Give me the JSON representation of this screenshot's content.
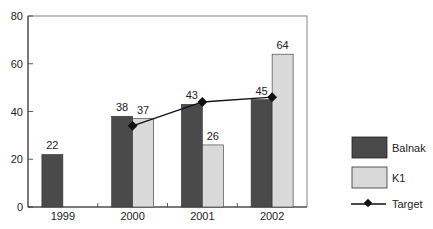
{
  "chart_data": {
    "type": "bar",
    "title": "",
    "xlabel": "",
    "ylabel": "",
    "ylim": [
      0,
      80
    ],
    "yticks": [
      0,
      20,
      40,
      60,
      80
    ],
    "grid": false,
    "legend_position": "right",
    "categories": [
      "1999",
      "2000",
      "2001",
      "2002"
    ],
    "series": [
      {
        "name": "Balnak",
        "type": "bar",
        "color": "#4a4a4a",
        "values": [
          22,
          38,
          43,
          45
        ]
      },
      {
        "name": "K1",
        "type": "bar",
        "color": "#d9d9d9",
        "values": [
          null,
          37,
          26,
          64
        ]
      },
      {
        "name": "Target",
        "type": "line",
        "color": "#111111",
        "marker": "diamond",
        "values": [
          null,
          34,
          44,
          46
        ]
      }
    ],
    "data_labels": {
      "Balnak": [
        "22",
        "38",
        "43",
        "45"
      ],
      "K1": [
        "",
        "37",
        "26",
        "64"
      ]
    }
  },
  "legend": {
    "items": [
      {
        "label": "Balnak"
      },
      {
        "label": "K1"
      },
      {
        "label": "Target"
      }
    ]
  }
}
